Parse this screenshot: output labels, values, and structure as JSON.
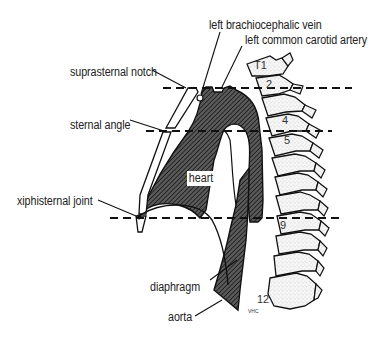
{
  "diagram": {
    "type": "anatomical-sagittal-section",
    "labels": {
      "left_brachiocephalic_vein": "left brachiocephalic vein",
      "left_common_carotid_artery": "left common carotid artery",
      "suprasternal_notch": "suprasternal notch",
      "sternal_angle": "sternal angle",
      "heart": "heart",
      "xiphisternal_joint": "xiphisternal joint",
      "diaphragm": "diaphragm",
      "aorta": "aorta"
    },
    "vertebrae": {
      "t1": "T1",
      "t2": "2",
      "t4": "4",
      "t5": "5",
      "t9": "9",
      "t12": "12"
    },
    "signature": "VHC",
    "reference_lines": [
      {
        "name": "suprasternal-notch-level",
        "vertebral_level": "T2-T3"
      },
      {
        "name": "sternal-angle-level",
        "vertebral_level": "T4-T5"
      },
      {
        "name": "xiphisternal-joint-level",
        "vertebral_level": "T9"
      }
    ],
    "colors": {
      "line": "#111111",
      "hatch_fill": "#3a3a3a",
      "bone_fill": "#f4f4f4",
      "background": "#ffffff"
    }
  }
}
